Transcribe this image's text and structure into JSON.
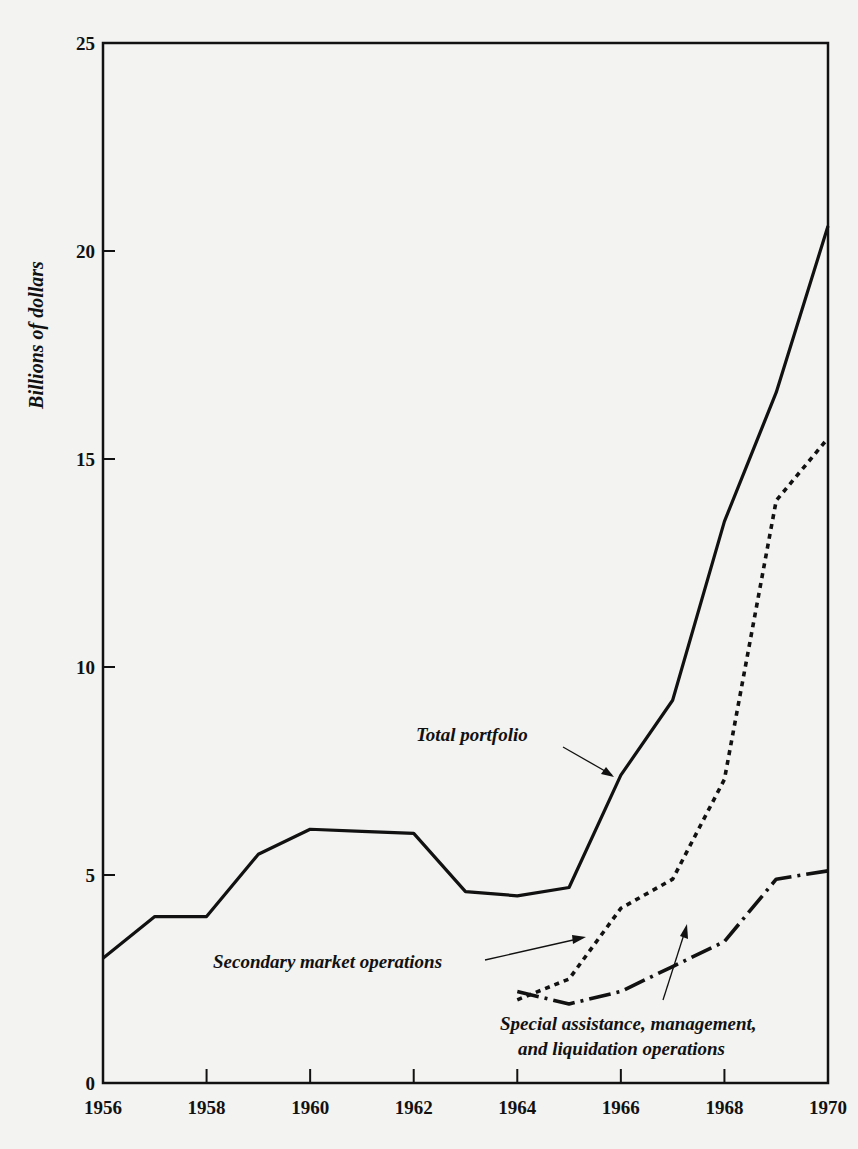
{
  "chart_data": {
    "type": "line",
    "title": "",
    "xlabel": "",
    "ylabel": "Billions of dollars",
    "xlim": [
      1956,
      1970
    ],
    "ylim": [
      0,
      25
    ],
    "x_ticks": [
      "1956",
      "1958",
      "1960",
      "1962",
      "1964",
      "1966",
      "1968",
      "1970"
    ],
    "y_ticks": [
      "0",
      "5",
      "10",
      "15",
      "20",
      "25"
    ],
    "grid": false,
    "legend": "annotations with arrows",
    "series": [
      {
        "name": "Total portfolio",
        "style": "solid",
        "x": [
          1956,
          1957,
          1958,
          1959,
          1960,
          1961,
          1962,
          1963,
          1964,
          1965,
          1966,
          1967,
          1968,
          1969,
          1970
        ],
        "values": [
          3.0,
          4.0,
          4.0,
          5.5,
          6.1,
          6.05,
          6.0,
          4.6,
          4.5,
          4.7,
          7.4,
          9.2,
          13.5,
          16.6,
          20.6
        ]
      },
      {
        "name": "Secondary market operations",
        "style": "dotted",
        "x": [
          1964,
          1965,
          1966,
          1967,
          1968,
          1969,
          1970
        ],
        "values": [
          2.0,
          2.5,
          4.2,
          4.9,
          7.3,
          14.0,
          15.5
        ]
      },
      {
        "name": "Special assistance, management, and liquidation operations",
        "style": "dash-dot",
        "x": [
          1964,
          1965,
          1966,
          1967,
          1968,
          1969,
          1970
        ],
        "values": [
          2.2,
          1.9,
          2.2,
          2.8,
          3.4,
          4.9,
          5.1
        ]
      }
    ],
    "annotations": [
      {
        "text": "Total portfolio",
        "target": "Total portfolio"
      },
      {
        "text": "Secondary market operations",
        "target": "Secondary market operations"
      },
      {
        "text": "Special assistance, management,",
        "text2": "and liquidation operations",
        "target": "Special assistance, management, and liquidation operations"
      }
    ]
  }
}
